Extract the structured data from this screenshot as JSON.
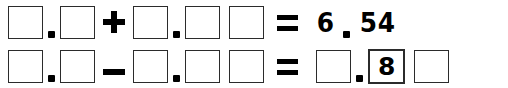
{
  "worksheet": {
    "kind": "decimal-arithmetic-fill-in-the-blanks",
    "blank_glyph": "",
    "rows": [
      {
        "id": "row-1",
        "operator": "+",
        "operator_name": "plus-icon",
        "relation": "=",
        "relation_name": "equals-icon",
        "decimal_point": ".",
        "operand_a": {
          "whole": "",
          "fraction": [
            ""
          ]
        },
        "operand_b": {
          "whole": "",
          "fraction": [
            "",
            ""
          ]
        },
        "result": {
          "whole": "6",
          "fraction": [
            "5",
            "4"
          ],
          "whole_filled": true,
          "fraction_filled": [
            true,
            true
          ]
        }
      },
      {
        "id": "row-2",
        "operator": "−",
        "operator_name": "minus-icon",
        "relation": "=",
        "relation_name": "equals-icon",
        "decimal_point": ".",
        "operand_a": {
          "whole": "",
          "fraction": [
            ""
          ]
        },
        "operand_b": {
          "whole": "",
          "fraction": [
            "",
            ""
          ]
        },
        "result": {
          "whole": "",
          "fraction": [
            "8",
            ""
          ],
          "whole_filled": false,
          "fraction_filled": [
            true,
            false
          ]
        }
      }
    ]
  },
  "colors": {
    "page_background": "#ffffff",
    "box_border": "#2b2b2b",
    "ink": "#000000"
  }
}
